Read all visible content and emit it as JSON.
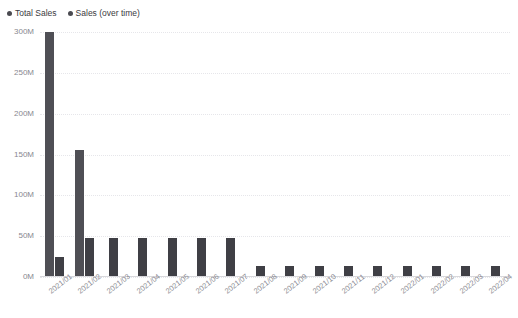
{
  "top_sliver_text": "",
  "legend": {
    "position": "top-left",
    "items": [
      {
        "label": "Total Sales",
        "color": "#4a4a50"
      },
      {
        "label": "Sales (over time)",
        "color": "#4a4a50"
      }
    ]
  },
  "chart_data": {
    "type": "bar",
    "title": "",
    "xlabel": "",
    "ylabel": "",
    "ylim": [
      0,
      300000000
    ],
    "ytick_labels": [
      "0M",
      "50M",
      "100M",
      "150M",
      "200M",
      "250M",
      "300M"
    ],
    "ytick_values": [
      0,
      50000000,
      100000000,
      150000000,
      200000000,
      250000000,
      300000000
    ],
    "grid": true,
    "grid_style": "dotted-horizontal",
    "legend_position": "top-left",
    "categories": [
      "2021/01",
      "2021/02",
      "2021/03",
      "2021/04",
      "2021/05",
      "2021/06",
      "2021/07",
      "2021/08",
      "2021/09",
      "2021/10",
      "2021/11",
      "2021/12",
      "2022/01",
      "2022/02",
      "2022/03",
      "2022/04"
    ],
    "series": [
      {
        "name": "Total Sales",
        "color": "#4f4f55",
        "values": [
          300000000,
          155000000,
          null,
          null,
          null,
          null,
          null,
          null,
          null,
          null,
          null,
          null,
          null,
          null,
          null,
          null
        ]
      },
      {
        "name": "Sales (over time)",
        "color": "#3f3f45",
        "values": [
          25000000,
          48000000,
          48000000,
          48000000,
          48000000,
          48000000,
          48000000,
          13000000,
          13000000,
          13000000,
          13000000,
          13000000,
          13000000,
          13000000,
          13000000,
          13000000
        ]
      }
    ]
  }
}
